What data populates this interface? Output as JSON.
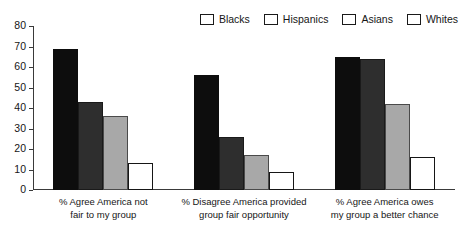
{
  "chart_data": {
    "type": "bar",
    "title": "",
    "subtitle": "",
    "xlabel": "",
    "ylabel": "",
    "ylim": [
      0,
      80
    ],
    "ytick_step": 10,
    "yticks": [
      0,
      10,
      20,
      30,
      40,
      50,
      60,
      70,
      80
    ],
    "grid": false,
    "legend_position": "top-right",
    "orientation": "vertical",
    "grouping": "grouped",
    "categories": [
      "% Agree America not fair to my group",
      "% Disagree America provided group fair opportunity",
      "% Agree America owes my group a better chance"
    ],
    "category_lines": [
      [
        "% Agree America not",
        "fair to my group"
      ],
      [
        "% Disagree America provided",
        "group fair opportunity"
      ],
      [
        "% Agree America owes",
        "my group a better chance"
      ]
    ],
    "series": [
      {
        "name": "Blacks",
        "color": "#0d0d0d",
        "values": [
          69,
          56,
          65
        ]
      },
      {
        "name": "Hispanics",
        "color": "#2e2e2e",
        "values": [
          43,
          26,
          64
        ]
      },
      {
        "name": "Asians",
        "color": "#a8a8a8",
        "values": [
          36,
          17,
          42
        ]
      },
      {
        "name": "Whites",
        "color": "#ffffff",
        "values": [
          13,
          9,
          16
        ]
      }
    ]
  },
  "legend": {
    "items": [
      {
        "label": "Blacks"
      },
      {
        "label": "Hispanics"
      },
      {
        "label": "Asians"
      },
      {
        "label": "Whites"
      }
    ]
  },
  "axis": {
    "y_labels": [
      "80",
      "70",
      "60",
      "50",
      "40",
      "30",
      "20",
      "10",
      "0"
    ]
  }
}
